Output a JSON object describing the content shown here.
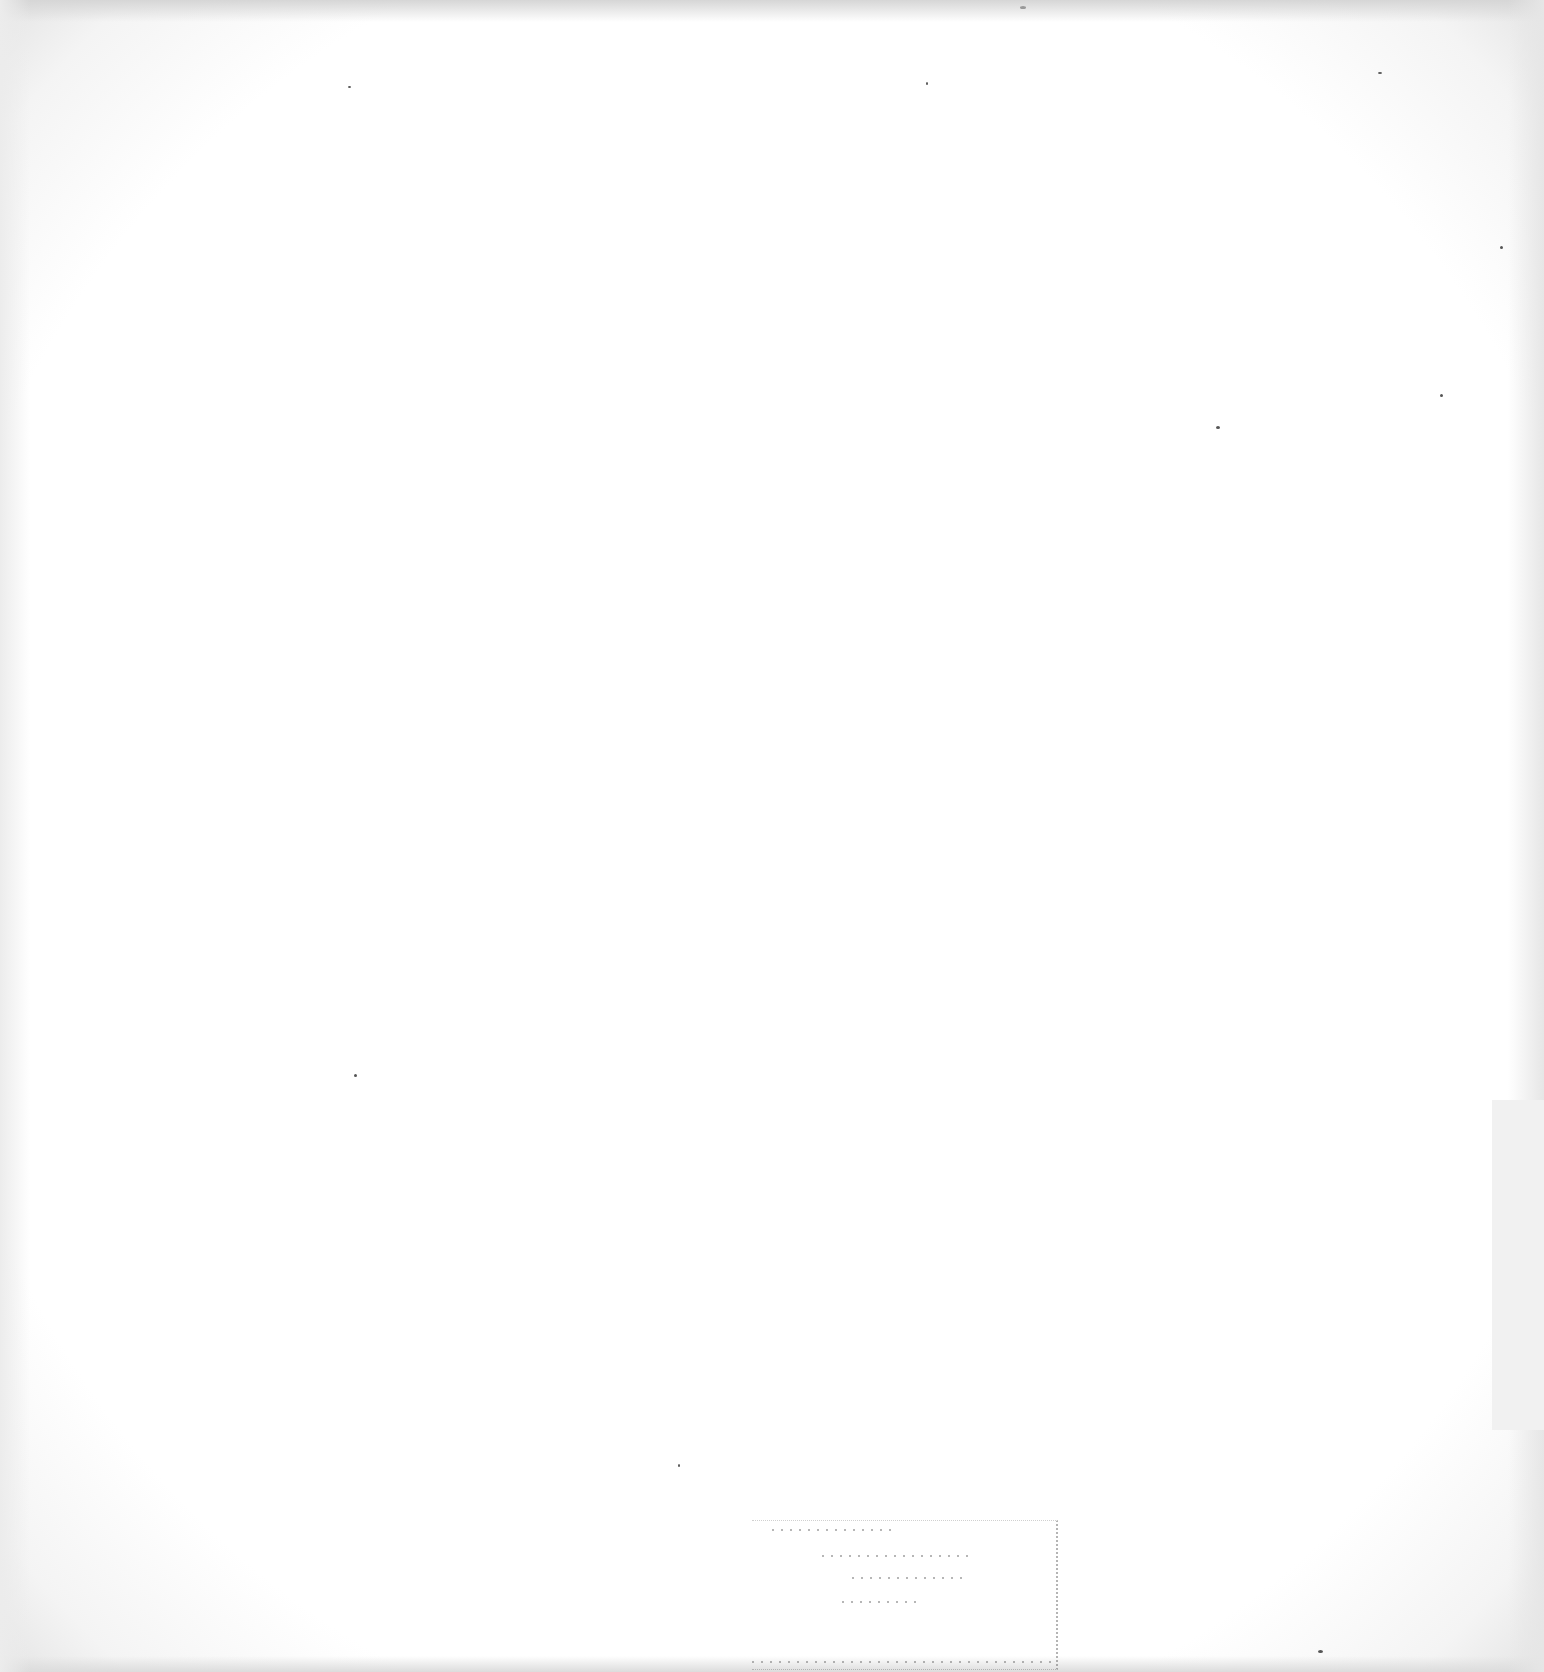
{
  "page": {
    "type": "blank scanned page",
    "background_color": "#ffffff",
    "edge_shade_color": "#e0e0e0",
    "visible_text": []
  },
  "stamp": {
    "legible": false,
    "text": ""
  }
}
